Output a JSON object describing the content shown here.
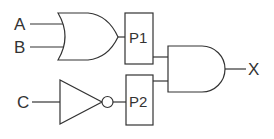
{
  "diagram": {
    "type": "logic-circuit",
    "inputs": [
      {
        "id": "A",
        "label": "A"
      },
      {
        "id": "B",
        "label": "B"
      },
      {
        "id": "C",
        "label": "C"
      }
    ],
    "gates": [
      {
        "id": "or1",
        "type": "OR",
        "inputs": [
          "A",
          "B"
        ],
        "output": "P1"
      },
      {
        "id": "not1",
        "type": "NOT",
        "inputs": [
          "C"
        ],
        "output": "P2"
      },
      {
        "id": "and1",
        "type": "AND",
        "inputs": [
          "P1",
          "P2"
        ],
        "output": "X"
      }
    ],
    "probes": [
      {
        "id": "P1",
        "label": "P1"
      },
      {
        "id": "P2",
        "label": "P2"
      }
    ],
    "output": {
      "id": "X",
      "label": "X"
    },
    "colors": {
      "stroke": "#333333",
      "background": "#ffffff"
    }
  }
}
